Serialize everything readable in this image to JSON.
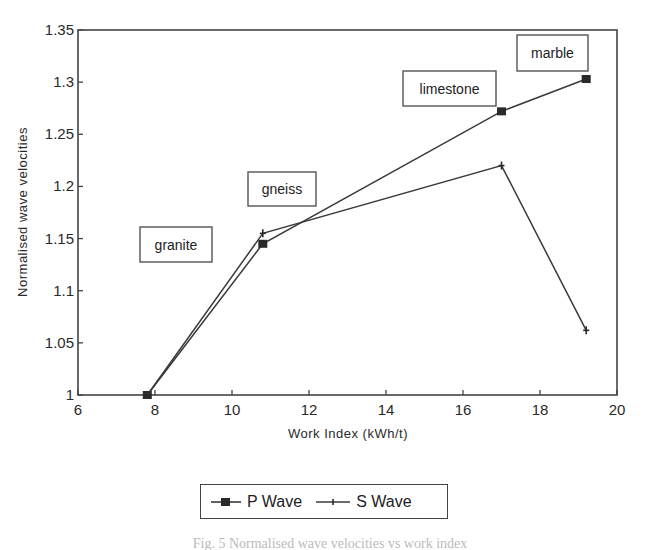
{
  "chart_data": {
    "type": "line",
    "title": "",
    "xlabel": "Work Index (kWh/t)",
    "ylabel": "Normalised wave velocities",
    "xlim": [
      6,
      20
    ],
    "ylim": [
      1,
      1.35
    ],
    "x_ticks": [
      6,
      8,
      10,
      12,
      14,
      16,
      18,
      20
    ],
    "y_ticks": [
      1,
      1.05,
      1.1,
      1.15,
      1.2,
      1.25,
      1.3,
      1.35
    ],
    "x_tick_labels": [
      "6",
      "8",
      "10",
      "12",
      "14",
      "16",
      "18",
      "20"
    ],
    "y_tick_labels": [
      "1",
      "1.05",
      "1.1",
      "1.15",
      "1.2",
      "1.25",
      "1.3",
      "1.35"
    ],
    "grid": false,
    "legend_position": "bottom",
    "x": [
      7.8,
      10.8,
      17.0,
      19.2
    ],
    "categories": [
      "granite",
      "gneiss",
      "limestone",
      "marble"
    ],
    "series": [
      {
        "name": "P Wave",
        "marker": "square",
        "values": [
          1.0,
          1.145,
          1.272,
          1.303
        ]
      },
      {
        "name": "S Wave",
        "marker": "plus",
        "values": [
          1.0,
          1.155,
          1.22,
          1.062
        ]
      }
    ],
    "annotations": [
      {
        "text": "granite",
        "box": [
          140,
          227,
          72,
          35
        ]
      },
      {
        "text": "gneiss",
        "box": [
          248,
          172,
          68,
          34
        ]
      },
      {
        "text": "limestone",
        "box": [
          403,
          71,
          93,
          35
        ]
      },
      {
        "text": "marble",
        "box": [
          517,
          35,
          71,
          36
        ]
      }
    ]
  },
  "legend": {
    "items": [
      {
        "label": "P Wave",
        "icon": "square-marker-line-icon"
      },
      {
        "label": "S Wave",
        "icon": "plus-marker-line-icon"
      }
    ]
  },
  "colors": {
    "line": "#3a3a3a",
    "marker": "#2a2a2a",
    "axis": "#444444",
    "background": "#ffffff"
  },
  "caption": "Fig. 5 Normalised wave velocities vs work index"
}
